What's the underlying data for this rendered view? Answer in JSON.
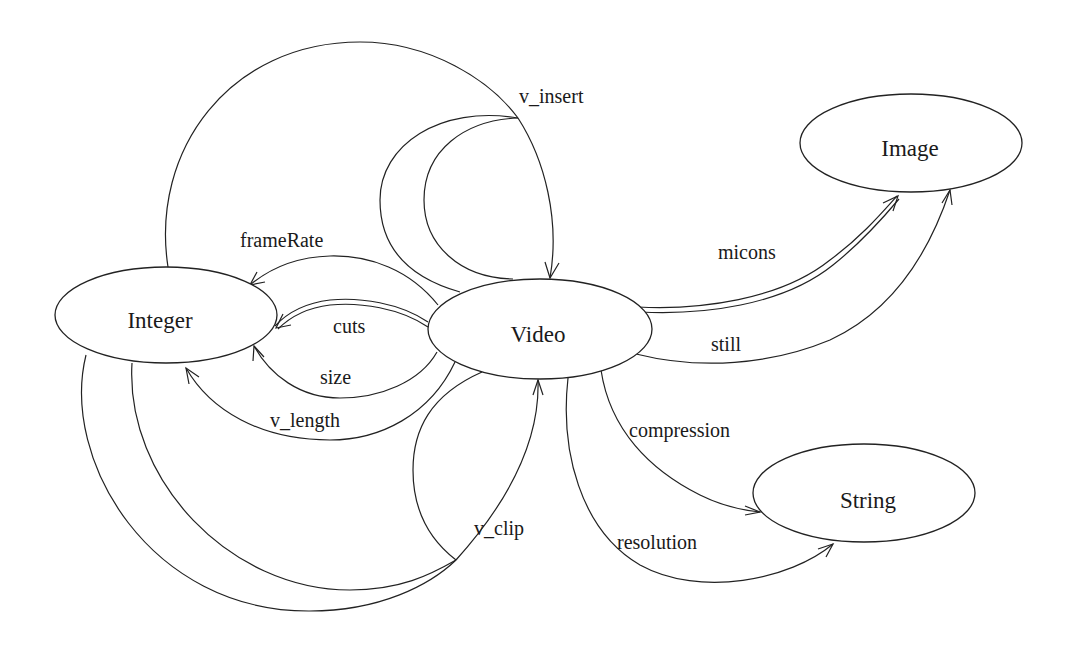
{
  "diagram": {
    "type": "schema-graph",
    "nodes": [
      {
        "id": "integer",
        "label": "Integer",
        "cx": 166,
        "cy": 315,
        "rx": 111,
        "ry": 48
      },
      {
        "id": "video",
        "label": "Video",
        "cx": 540,
        "cy": 329,
        "rx": 112,
        "ry": 50
      },
      {
        "id": "image",
        "label": "Image",
        "cx": 911,
        "cy": 143,
        "rx": 111,
        "ry": 49
      },
      {
        "id": "string",
        "label": "String",
        "cx": 864,
        "cy": 493,
        "rx": 111,
        "ry": 49
      }
    ],
    "edges": [
      {
        "id": "frameRate",
        "label": "frameRate",
        "from": "Video",
        "to": "Integer",
        "label_x": 240,
        "label_y": 230
      },
      {
        "id": "cuts",
        "label": "cuts",
        "from": "Video",
        "to": "Integer",
        "multi": true,
        "label_x": 333,
        "label_y": 316
      },
      {
        "id": "size",
        "label": "size",
        "from": "Video",
        "to": "Integer",
        "label_x": 320,
        "label_y": 367
      },
      {
        "id": "v_length",
        "label": "v_length",
        "from": "Video",
        "to": "Integer",
        "label_x": 270,
        "label_y": 410
      },
      {
        "id": "v_insert",
        "label": "v_insert",
        "from": "Video, Video, Integer",
        "to": "Video",
        "label_x": 519,
        "label_y": 86
      },
      {
        "id": "v_clip",
        "label": "v_clip",
        "from": "Video, Integer, Integer",
        "to": "Video",
        "label_x": 474,
        "label_y": 518
      },
      {
        "id": "micons",
        "label": "micons",
        "from": "Video",
        "to": "Image",
        "multi": true,
        "label_x": 718,
        "label_y": 242
      },
      {
        "id": "still",
        "label": "still",
        "from": "Video",
        "to": "Image",
        "label_x": 711,
        "label_y": 334
      },
      {
        "id": "compression",
        "label": "compression",
        "from": "Video",
        "to": "String",
        "label_x": 629,
        "label_y": 420
      },
      {
        "id": "resolution",
        "label": "resolution",
        "from": "Video",
        "to": "String",
        "label_x": 617,
        "label_y": 532
      }
    ]
  },
  "colors": {
    "stroke": "#222222",
    "text": "#1a1a1a",
    "background": "#ffffff"
  }
}
